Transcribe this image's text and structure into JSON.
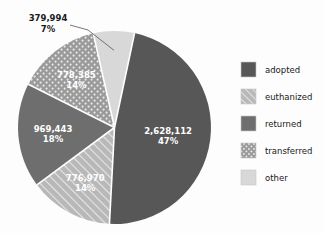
{
  "chart_data": {
    "type": "pie",
    "title": "",
    "subtitle": "",
    "xlabel": "",
    "ylabel": "",
    "legend_position": "right",
    "grid": false,
    "categories": [
      "adopted",
      "euthanized",
      "returned",
      "transferred",
      "other"
    ],
    "values": [
      2628112,
      776970,
      969443,
      778385,
      379994
    ],
    "percentages": [
      47,
      14,
      18,
      14,
      7
    ],
    "value_labels": [
      "2,628,112",
      "776,970",
      "969,443",
      "778,385",
      "379,994"
    ],
    "percent_labels": [
      "47%",
      "14%",
      "18%",
      "14%",
      "7%"
    ],
    "colors": [
      "#575757",
      "#b0b0b0",
      "#6e6e6e",
      "#9a9a9a",
      "#d8d8d8"
    ],
    "patterns": [
      "solid",
      "diagonal-hatch",
      "solid",
      "dots",
      "solid"
    ],
    "label_placement": [
      "inside",
      "inside",
      "inside",
      "inside",
      "outside"
    ],
    "start_angle_deg": 12,
    "direction": "clockwise"
  },
  "legend": {
    "items": [
      {
        "label": "adopted"
      },
      {
        "label": "euthanized"
      },
      {
        "label": "returned"
      },
      {
        "label": "transferred"
      },
      {
        "label": "other"
      }
    ]
  },
  "slices": [
    {
      "name": "adopted",
      "value_label": "2,628,112",
      "percent_label": "47%"
    },
    {
      "name": "euthanized",
      "value_label": "776,970",
      "percent_label": "14%"
    },
    {
      "name": "returned",
      "value_label": "969,443",
      "percent_label": "18%"
    },
    {
      "name": "transferred",
      "value_label": "778,385",
      "percent_label": "14%"
    },
    {
      "name": "other",
      "value_label": "379,994",
      "percent_label": "7%"
    }
  ]
}
